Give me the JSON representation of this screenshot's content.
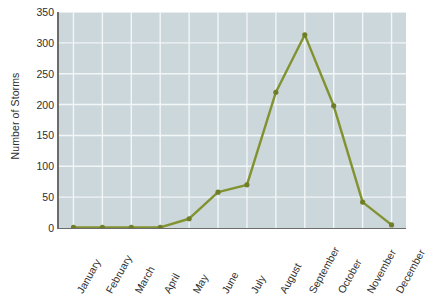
{
  "chart_data": {
    "type": "line",
    "title": "",
    "xlabel": "",
    "ylabel": "Number of Storms",
    "categories": [
      "January",
      "February",
      "March",
      "April",
      "May",
      "June",
      "July",
      "August",
      "September",
      "October",
      "November",
      "December"
    ],
    "values": [
      1,
      1,
      1,
      1,
      15,
      58,
      70,
      220,
      313,
      198,
      42,
      5
    ],
    "series": [
      {
        "name": "Number of Storms",
        "values": [
          1,
          1,
          1,
          1,
          15,
          58,
          70,
          220,
          313,
          198,
          42,
          5
        ]
      }
    ],
    "ylim": [
      0,
      350
    ],
    "y_ticks": [
      0,
      50,
      100,
      150,
      200,
      250,
      300,
      350
    ],
    "y_tick_labels": [
      "0",
      "50",
      "100",
      "150",
      "200",
      "250",
      "300",
      "350"
    ],
    "grid": true,
    "legend": "none",
    "colors": {
      "line": "#81922e",
      "marker": "#707f27",
      "plot_background": "#ccd7dc",
      "gridline": "#f2f6f7",
      "axis": "#6c6c6c",
      "page_background": "#ffffff",
      "text": "#2e2e2e"
    }
  }
}
